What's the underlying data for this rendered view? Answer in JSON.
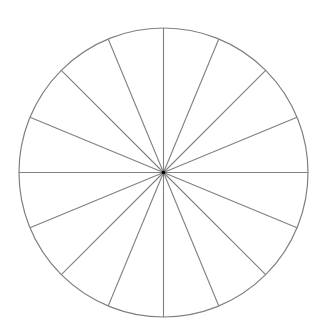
{
  "diagram": {
    "type": "segmented-circle",
    "segments": 16,
    "center": [
      163.5,
      172.5
    ],
    "radius": 144.5,
    "stroke_color": "#808080",
    "center_color": "#000000",
    "background": "#ffffff"
  }
}
